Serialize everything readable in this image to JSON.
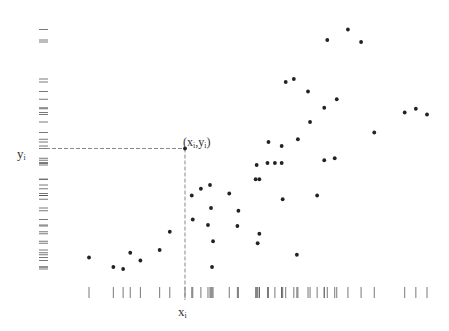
{
  "chart_data": {
    "type": "scatter",
    "title": "",
    "xlabel": "x_i",
    "ylabel": "y_i",
    "grid": false,
    "legend": null,
    "rug_x": true,
    "rug_y": true,
    "note": "Values in pixel-derived data units: x = horizontal position (0-100 across plot), y = height above baseline (0-100).",
    "xlim": [
      0,
      100
    ],
    "ylim": [
      0,
      100
    ],
    "highlight": {
      "label": "(x_i,y_i)",
      "x": 28.4,
      "y": 48.2,
      "dashed_projections": true
    },
    "points": [
      {
        "x": 0.0,
        "y": 4.6
      },
      {
        "x": 7.2,
        "y": 0.8
      },
      {
        "x": 10.1,
        "y": 0.0
      },
      {
        "x": 12.2,
        "y": 6.5
      },
      {
        "x": 15.2,
        "y": 3.4
      },
      {
        "x": 20.9,
        "y": 7.6
      },
      {
        "x": 23.9,
        "y": 14.9
      },
      {
        "x": 28.4,
        "y": 48.2
      },
      {
        "x": 30.4,
        "y": 29.4
      },
      {
        "x": 30.7,
        "y": 19.8
      },
      {
        "x": 33.1,
        "y": 32.1
      },
      {
        "x": 35.2,
        "y": 17.6
      },
      {
        "x": 35.8,
        "y": 33.6
      },
      {
        "x": 36.1,
        "y": 24.4
      },
      {
        "x": 36.7,
        "y": 11.1
      },
      {
        "x": 36.4,
        "y": 0.8
      },
      {
        "x": 41.5,
        "y": 30.2
      },
      {
        "x": 43.9,
        "y": 17.2
      },
      {
        "x": 44.2,
        "y": 23.3
      },
      {
        "x": 49.3,
        "y": 35.9
      },
      {
        "x": 50.4,
        "y": 35.9
      },
      {
        "x": 49.6,
        "y": 41.6
      },
      {
        "x": 50.4,
        "y": 14.1
      },
      {
        "x": 49.9,
        "y": 10.3
      },
      {
        "x": 52.8,
        "y": 42.4
      },
      {
        "x": 53.1,
        "y": 50.8
      },
      {
        "x": 55.0,
        "y": 42.4
      },
      {
        "x": 57.0,
        "y": 42.4
      },
      {
        "x": 57.0,
        "y": 49.2
      },
      {
        "x": 57.3,
        "y": 27.9
      },
      {
        "x": 58.2,
        "y": 74.8
      },
      {
        "x": 60.6,
        "y": 76.0
      },
      {
        "x": 61.5,
        "y": 5.7
      },
      {
        "x": 61.8,
        "y": 51.9
      },
      {
        "x": 64.8,
        "y": 71.0
      },
      {
        "x": 65.4,
        "y": 58.8
      },
      {
        "x": 67.5,
        "y": 29.4
      },
      {
        "x": 69.6,
        "y": 64.5
      },
      {
        "x": 69.6,
        "y": 43.5
      },
      {
        "x": 70.5,
        "y": 91.6
      },
      {
        "x": 72.7,
        "y": 44.3
      },
      {
        "x": 73.3,
        "y": 67.9
      },
      {
        "x": 76.6,
        "y": 95.8
      },
      {
        "x": 80.5,
        "y": 90.8
      },
      {
        "x": 84.4,
        "y": 54.6
      },
      {
        "x": 93.4,
        "y": 62.6
      },
      {
        "x": 96.7,
        "y": 64.1
      },
      {
        "x": 100.0,
        "y": 61.8
      }
    ]
  },
  "labels": {
    "xi": "x",
    "xi_sub": "i",
    "yi": "y",
    "yi_sub": "i",
    "point_label_open": "(x",
    "point_label_sub1": "i",
    "point_label_mid": ",y",
    "point_label_sub2": "i",
    "point_label_close": ")"
  },
  "style": {
    "dot_color": "#222222",
    "rug_color": "#555555",
    "dash_color": "#888888",
    "text_color": "#333333"
  }
}
